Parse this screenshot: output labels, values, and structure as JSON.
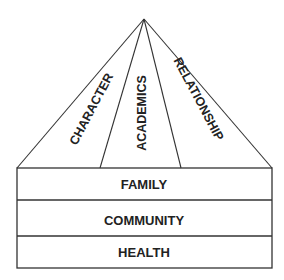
{
  "diagram": {
    "type": "pyramid-with-base",
    "roof_sections": [
      {
        "label": "CHARACTER"
      },
      {
        "label": "ACADEMICS"
      },
      {
        "label": "RELATIONSHIP"
      }
    ],
    "base_layers": [
      {
        "label": "FAMILY"
      },
      {
        "label": "COMMUNITY"
      },
      {
        "label": "HEALTH"
      }
    ],
    "colors": {
      "stroke": "#333333",
      "text": "#222222",
      "background": "#ffffff"
    }
  }
}
